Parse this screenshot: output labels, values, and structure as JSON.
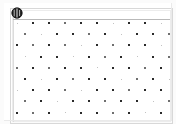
{
  "viewer": {
    "width": 176,
    "height": 124,
    "background_color": "#fdfdfd",
    "paper_color": "#ffffff",
    "margin_color": "#fbfbfb"
  },
  "sheet": {
    "label": "scanned-sheet",
    "x": 4,
    "y": 3,
    "width": 168,
    "height": 118
  },
  "frame": {
    "outer_color": "#d8d8d8",
    "inner_color": "#ececec",
    "header_rule_color": "#b9b9b9",
    "left_rule_color": "#dcdcdc"
  },
  "stamp": {
    "name": "stamp-icon",
    "description": "dark circular stamp mark",
    "color": "#1f1f1f",
    "x": 7,
    "y": 4,
    "size": 12
  },
  "dot_grid": {
    "description": "staggered grid of small square dots on scanned sheet",
    "dark_color": "#2a2a2a",
    "mid_color": "#6f6f6f",
    "light_color": "#c2c2c2",
    "origin_x": 13,
    "origin_y": 20,
    "step_x": 16.0,
    "step_y": 11.2,
    "columns": 10,
    "rows": 9,
    "stagger_x": 8.0,
    "dot_size_dark": 2,
    "dot_size_mid": 2,
    "dot_size_light": 1,
    "rows_data": [
      {
        "row": 0,
        "offset": false,
        "dots": [
          "light",
          "dark",
          "dark",
          "mid",
          "dark",
          "dark",
          "light",
          "dark",
          "dark",
          "light"
        ]
      },
      {
        "row": 1,
        "offset": true,
        "dots": [
          "mid",
          "light",
          "dark",
          "dark",
          "mid",
          "dark",
          "light",
          "dark",
          "dark",
          "mid"
        ]
      },
      {
        "row": 2,
        "offset": false,
        "dots": [
          "dark",
          "mid",
          "dark",
          "mid",
          "light",
          "dark",
          "mid",
          "dark",
          "dark",
          "light"
        ]
      },
      {
        "row": 3,
        "offset": true,
        "dots": [
          "light",
          "dark",
          "dark",
          "light",
          "dark",
          "mid",
          "dark",
          "light",
          "dark",
          "mid"
        ]
      },
      {
        "row": 4,
        "offset": false,
        "dots": [
          "mid",
          "dark",
          "mid",
          "dark",
          "dark",
          "light",
          "dark",
          "dark",
          "mid",
          "dark"
        ]
      },
      {
        "row": 5,
        "offset": true,
        "dots": [
          "dark",
          "light",
          "dark",
          "mid",
          "dark",
          "dark",
          "light",
          "mid",
          "dark",
          "light"
        ]
      },
      {
        "row": 6,
        "offset": false,
        "dots": [
          "light",
          "dark",
          "dark",
          "mid",
          "light",
          "dark",
          "dark",
          "mid",
          "dark",
          "dark"
        ]
      },
      {
        "row": 7,
        "offset": true,
        "dots": [
          "mid",
          "dark",
          "light",
          "dark",
          "dark",
          "mid",
          "dark",
          "dark",
          "light",
          "mid"
        ]
      },
      {
        "row": 8,
        "offset": false,
        "dots": [
          "dark",
          "mid",
          "dark",
          "light",
          "dark",
          "dark",
          "mid",
          "dark",
          "light",
          "dark"
        ]
      }
    ]
  },
  "scan_edges": {
    "bottom_color": "#eaeaea",
    "right_color": "#eaeaea"
  }
}
